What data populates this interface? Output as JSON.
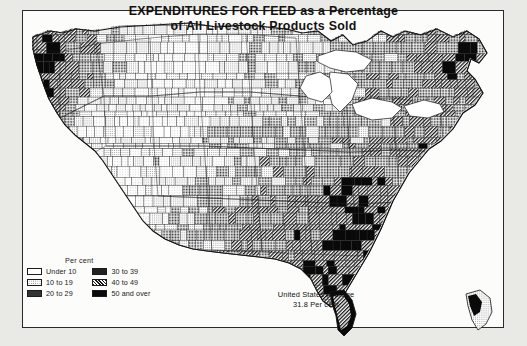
{
  "title": {
    "line1": "EXPENDITURES FOR FEED as a Percentage",
    "line2": "of All Livestock Products Sold"
  },
  "legend": {
    "heading": "Per cent",
    "column_left": [
      {
        "label": "Under 10",
        "swatch": "white",
        "range": [
          0,
          10
        ]
      },
      {
        "label": "10 to 19",
        "swatch": "light-stipple",
        "range": [
          10,
          19
        ]
      },
      {
        "label": "20 to 29",
        "swatch": "medium-stipple",
        "range": [
          20,
          29
        ]
      }
    ],
    "column_right": [
      {
        "label": "30 to 39",
        "swatch": "dense-stipple",
        "range": [
          30,
          39
        ]
      },
      {
        "label": "40 to 49",
        "swatch": "diagonal-hatch",
        "range": [
          40,
          49
        ]
      },
      {
        "label": "50 and over",
        "swatch": "solid-black",
        "range": [
          50,
          100
        ]
      }
    ]
  },
  "annotation": {
    "average_label": "United States Average",
    "average_value": "31.8 Per cent"
  },
  "chart_data": {
    "type": "heatmap",
    "title": "EXPENDITURES FOR FEED as a Percentage of All Livestock Products Sold",
    "unit": "per cent",
    "geography": "United States counties (conterminous 48 states)",
    "classes": [
      "Under 10",
      "10 to 19",
      "20 to 29",
      "30 to 39",
      "40 to 49",
      "50 and over"
    ],
    "national_average": 31.8,
    "regional_readings": [
      {
        "region": "Pacific Northwest coast",
        "class": "50 and over"
      },
      {
        "region": "Great Basin / Nevada",
        "class": "10 to 19"
      },
      {
        "region": "Northern Great Plains",
        "class": "10 to 19"
      },
      {
        "region": "Corn Belt",
        "class": "20 to 29"
      },
      {
        "region": "Upper Midwest / Wisconsin",
        "class": "20 to 29"
      },
      {
        "region": "Southern Appalachia",
        "class": "40 to 49"
      },
      {
        "region": "Deep South / Gulf Coast",
        "class": "50 and over"
      },
      {
        "region": "Florida peninsula",
        "class": "50 and over"
      },
      {
        "region": "New England",
        "class": "40 to 49"
      },
      {
        "region": "Southwest desert",
        "class": "Under 10"
      }
    ]
  }
}
